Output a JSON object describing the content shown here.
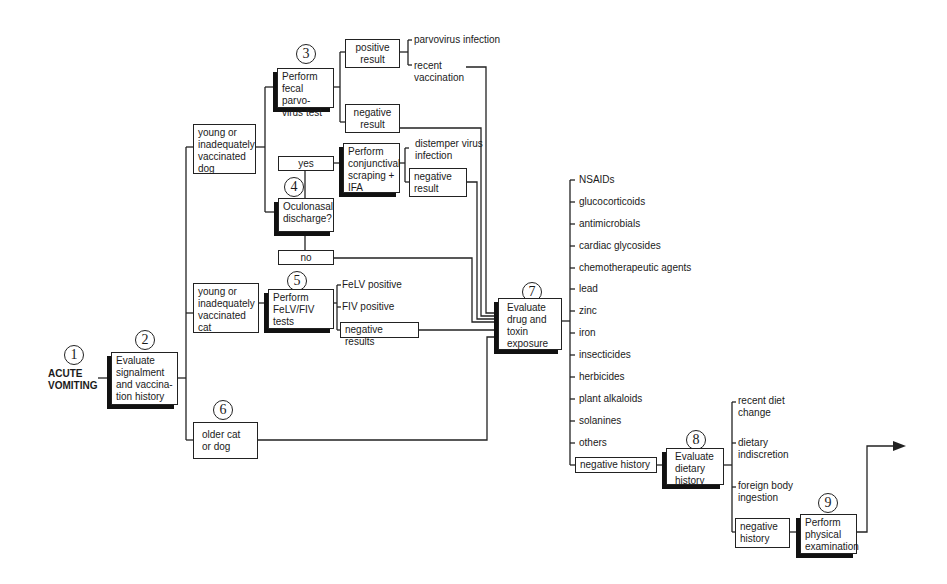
{
  "diagram": {
    "type": "flowchart",
    "colors": {
      "line": "#222222",
      "shadow": "#111111",
      "background": "#ffffff",
      "text": "#1a1a1a"
    }
  },
  "steps": {
    "s1": {
      "number": "1",
      "label_line1": "ACUTE",
      "label_line2": "VOMITING"
    },
    "s2": {
      "number": "2",
      "text": "Evaluate signalment and vaccina-tion history"
    },
    "s3": {
      "number": "3",
      "text": "Perform fecal parvo-virus test"
    },
    "s4": {
      "number": "4",
      "text": "Oculonasal discharge?"
    },
    "s5": {
      "number": "5",
      "text": "Perform FeLV/FIV tests"
    },
    "s6": {
      "number": "6",
      "text": "older cat or dog"
    },
    "s7": {
      "number": "7",
      "text": "Evaluate drug and toxin exposure"
    },
    "s8": {
      "number": "8",
      "text": "Evaluate dietary history"
    },
    "s9": {
      "number": "9",
      "text": "Perform physical examination"
    }
  },
  "branches": {
    "young_dog": "young or inadequately vaccinated dog",
    "young_cat": "young or inadequately vaccinated cat",
    "parvo_positive": "positive result",
    "parvo_negative": "negative result",
    "parvo_infection": "parvovirus infection",
    "recent_vaccination": "recent vaccination",
    "yes": "yes",
    "no": "no",
    "conjunctival": "Perform conjunctival scraping + IFA",
    "distemper": "distemper virus infection",
    "ifa_negative": "negative result",
    "felv_positive": "FeLV positive",
    "fiv_positive": "FIV positive",
    "felv_negative": "negative results"
  },
  "toxins": {
    "items": [
      "NSAIDs",
      "glucocorticoids",
      "antimicrobials",
      "cardiac glycosides",
      "chemotherapeutic agents",
      "lead",
      "zinc",
      "iron",
      "insecticides",
      "herbicides",
      "plant alkaloids",
      "solanines",
      "others"
    ],
    "negative": "negative history"
  },
  "dietary": {
    "items": [
      "recent diet change",
      "dietary indiscretion",
      "foreign body ingestion"
    ],
    "negative": "negative history"
  }
}
